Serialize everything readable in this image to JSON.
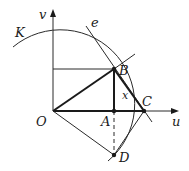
{
  "diagram": {
    "axes": {
      "horizontal_label": "u",
      "vertical_label": "v",
      "origin": {
        "x": 53,
        "y": 111
      },
      "u_end": {
        "x": 178,
        "y": 111
      },
      "v_end": {
        "x": 53,
        "y": 9
      }
    },
    "curve": {
      "label": "K",
      "center": "O",
      "radius": 74
    },
    "tangent_line": {
      "label": "e"
    },
    "points": {
      "O": {
        "label": "O",
        "x": 53,
        "y": 111
      },
      "A": {
        "label": "A",
        "x": 114,
        "y": 111
      },
      "B": {
        "label": "B",
        "x": 114,
        "y": 69
      },
      "C": {
        "label": "C",
        "x": 144,
        "y": 111
      },
      "D": {
        "label": "D",
        "x": 114,
        "y": 155
      }
    },
    "arc_label": "x",
    "colors": {
      "stroke": "#1a1a1a",
      "background": "#ffffff"
    }
  }
}
